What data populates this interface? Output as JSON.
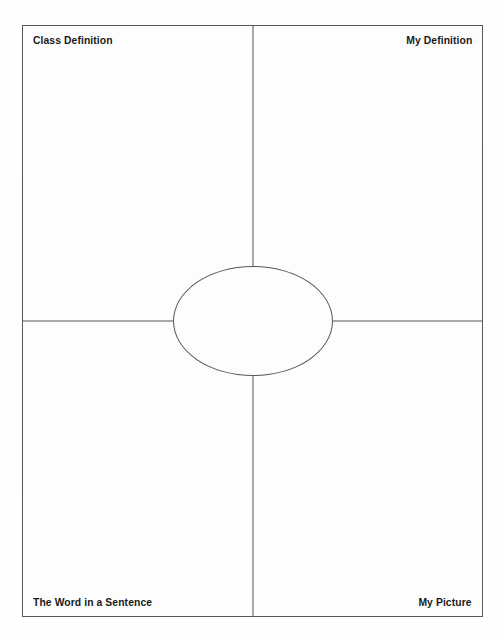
{
  "worksheet": {
    "type": "frayer-model-graphic-organizer",
    "quadrants": [
      {
        "id": "class-definition",
        "label": "Class Definition",
        "position": "top-left"
      },
      {
        "id": "my-definition",
        "label": "My Definition",
        "position": "top-right"
      },
      {
        "id": "word-in-a-sentence",
        "label": "The Word in a Sentence",
        "position": "bottom-left"
      },
      {
        "id": "my-picture",
        "label": "My Picture",
        "position": "bottom-right"
      }
    ],
    "center": {
      "shape": "ellipse",
      "label": ""
    },
    "colors": {
      "line": "#55575a",
      "text": "#1a1a1a",
      "paper": "#fdfdfd",
      "background": "#ffffff"
    }
  }
}
